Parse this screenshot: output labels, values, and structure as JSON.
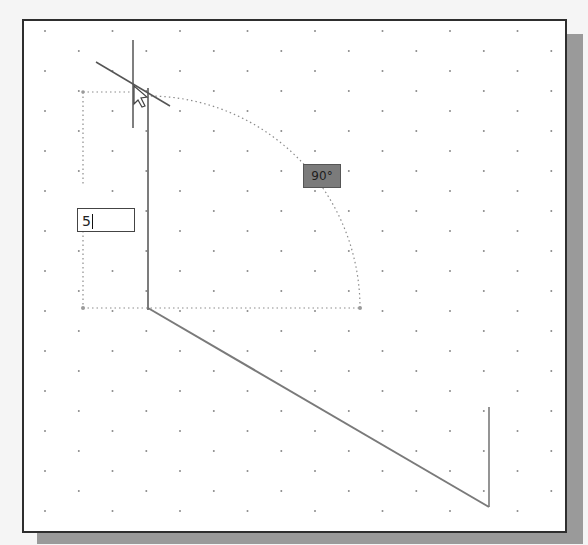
{
  "drawing_area": {
    "background": "#ffffff",
    "border_color": "#2e2e2e",
    "shadow_color": "#9a9a9a",
    "grid": {
      "style": "dots-staggered",
      "spacing_x": 67.5,
      "spacing_y": 20,
      "dot_color": "#8a8a8a"
    }
  },
  "dynamic_input": {
    "value": "5",
    "has_caret": true
  },
  "angle_tooltip": {
    "label": "90°",
    "fill": "#7b7b7b"
  },
  "geometry": {
    "line_color": "#7a7a7a",
    "existing_lines": [
      {
        "x1": 148,
        "y1": 308,
        "x2": 489,
        "y2": 507
      },
      {
        "x1": 489,
        "y1": 507,
        "x2": 489,
        "y2": 407
      }
    ],
    "rubber_band_line": {
      "x1": 148,
      "y1": 308,
      "x2": 148,
      "y2": 88
    },
    "tracking_arc": {
      "cx": 148,
      "cy": 308,
      "r": 212,
      "start_deg": 0,
      "end_deg": 90
    },
    "extension_lines": [
      {
        "x1": 83,
        "y1": 92,
        "x2": 148,
        "y2": 92
      },
      {
        "x1": 83,
        "y1": 92,
        "x2": 83,
        "y2": 308
      },
      {
        "x1": 83,
        "y1": 308,
        "x2": 360,
        "y2": 308
      }
    ]
  },
  "cursor": {
    "type": "crosshair",
    "vertical": {
      "x": 133,
      "y1": 40,
      "y2": 128
    },
    "angled": {
      "x1": 96,
      "y1": 62,
      "x2": 170,
      "y2": 106
    },
    "pointer_at": {
      "x": 133,
      "y": 85
    }
  }
}
